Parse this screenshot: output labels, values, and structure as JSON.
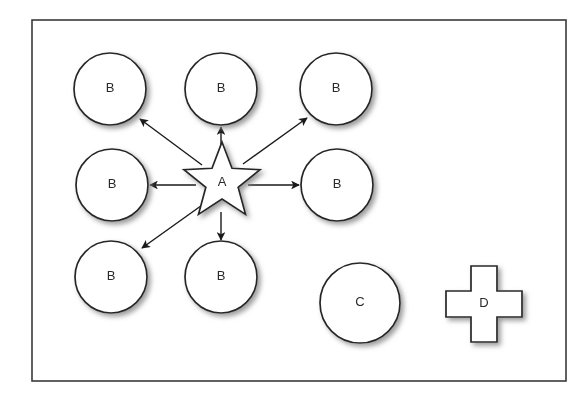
{
  "diagram": {
    "frame": {
      "name": "outer-border",
      "x": 32,
      "y": 20,
      "width": 534,
      "height": 361,
      "stroke": "#3a3a3a",
      "fill": "#ffffff",
      "stroke_width": 1.6
    },
    "style": {
      "shape_stroke": "#262626",
      "shape_fill": "#ffffff",
      "shape_stroke_width": 1.7,
      "arrow_stroke": "#1a1a1a",
      "arrow_stroke_width": 1.4,
      "label_color": "#2b2b2b",
      "shadow_color": "#9a9a9a"
    },
    "nodes": [
      {
        "id": "b1",
        "label": "B",
        "shape": "circle",
        "cx": 110,
        "cy": 89,
        "r": 36,
        "name": "node-b-top-left"
      },
      {
        "id": "b2",
        "label": "B",
        "shape": "circle",
        "cx": 221,
        "cy": 89,
        "r": 36,
        "name": "node-b-top-center"
      },
      {
        "id": "b3",
        "label": "B",
        "shape": "circle",
        "cx": 336,
        "cy": 89,
        "r": 36,
        "name": "node-b-top-right"
      },
      {
        "id": "b4",
        "label": "B",
        "shape": "circle",
        "cx": 112,
        "cy": 185,
        "r": 36,
        "name": "node-b-middle-left"
      },
      {
        "id": "b5",
        "label": "B",
        "shape": "circle",
        "cx": 337,
        "cy": 185,
        "r": 36,
        "name": "node-b-middle-right"
      },
      {
        "id": "b6",
        "label": "B",
        "shape": "circle",
        "cx": 111,
        "cy": 277,
        "r": 36,
        "name": "node-b-bottom-left"
      },
      {
        "id": "b7",
        "label": "B",
        "shape": "circle",
        "cx": 221,
        "cy": 277,
        "r": 36,
        "name": "node-b-bottom-center"
      },
      {
        "id": "c1",
        "label": "C",
        "shape": "circle",
        "cx": 360,
        "cy": 303,
        "r": 40,
        "name": "node-c-circle"
      },
      {
        "id": "a1",
        "label": "A",
        "shape": "star",
        "cx": 222,
        "cy": 182,
        "outer_r": 40,
        "inner_r": 17,
        "points": 5,
        "name": "node-a-star"
      },
      {
        "id": "d1",
        "label": "D",
        "shape": "cross",
        "cx": 484,
        "cy": 304,
        "size": 76,
        "arm": 26,
        "name": "node-d-cross"
      }
    ],
    "edges": [
      {
        "from": "a1",
        "to": "b1",
        "name": "arrow-a-to-b-top-left",
        "x1": 202,
        "y1": 165,
        "x2": 140,
        "y2": 119,
        "arrowhead": "end"
      },
      {
        "from": "a1",
        "to": "b2",
        "name": "arrow-a-to-b-top-center",
        "x1": 221,
        "y1": 158,
        "x2": 221,
        "y2": 127,
        "arrowhead": "end"
      },
      {
        "from": "a1",
        "to": "b3",
        "name": "arrow-a-to-b-top-right",
        "x1": 243,
        "y1": 164,
        "x2": 307,
        "y2": 118,
        "arrowhead": "end"
      },
      {
        "from": "a1",
        "to": "b4",
        "name": "arrow-a-to-b-middle-left",
        "x1": 196,
        "y1": 185,
        "x2": 150,
        "y2": 185,
        "arrowhead": "end"
      },
      {
        "from": "a1",
        "to": "b5",
        "name": "arrow-a-to-b-middle-right",
        "x1": 248,
        "y1": 185,
        "x2": 299,
        "y2": 185,
        "arrowhead": "end"
      },
      {
        "from": "a1",
        "to": "b6",
        "name": "arrow-a-to-b-bottom-left",
        "x1": 205,
        "y1": 203,
        "x2": 142,
        "y2": 248,
        "arrowhead": "end"
      },
      {
        "from": "a1",
        "to": "b7",
        "name": "arrow-a-to-b-bottom-center",
        "x1": 221,
        "y1": 212,
        "x2": 221,
        "y2": 240,
        "arrowhead": "end"
      }
    ]
  }
}
